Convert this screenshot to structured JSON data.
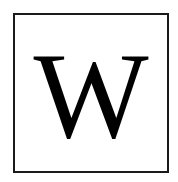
{
  "logo": {
    "letter": "W",
    "colors": {
      "border": "#1a1a1a",
      "letter": "#000000",
      "background": "#ffffff"
    }
  }
}
